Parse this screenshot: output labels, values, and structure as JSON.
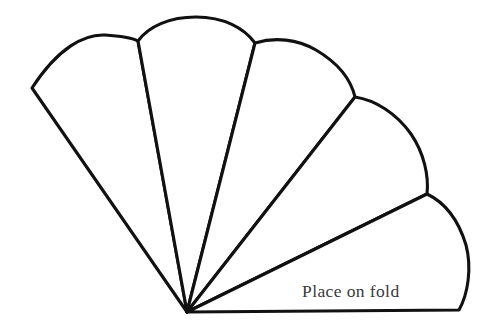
{
  "document": {
    "title": "Fan Pattern Template",
    "kind": "line-art craft pattern",
    "background_color": "#ffffff",
    "line_color": "#111111",
    "width": 492,
    "height": 333
  },
  "labels": {
    "fold_text": "Place on fold",
    "fold_text_color": "#3a3a3a",
    "fold_text_x": 302,
    "fold_text_y": 297
  },
  "pattern": {
    "name": "five-blade folding fan",
    "pivot": {
      "x": 187,
      "y": 312
    },
    "blade_count": 5,
    "vertices": {
      "left_tip": {
        "x": 32,
        "y": 88
      },
      "junction_1_2": {
        "x": 138,
        "y": 41
      },
      "junction_2_3": {
        "x": 255,
        "y": 43
      },
      "junction_3_4": {
        "x": 355,
        "y": 97
      },
      "junction_4_5": {
        "x": 427,
        "y": 194
      },
      "bottom_right_corner": {
        "x": 459,
        "y": 310
      }
    },
    "blades": [
      {
        "id": "blade-1",
        "label": "leftmost blade",
        "path": "M 187 312 L 32 88 C 58 48 84 34 105 35 C 121 36 132 38 138 41 Z"
      },
      {
        "id": "blade-2",
        "label": "second blade",
        "path": "M 187 312 L 138 41 C 149 26 170 17 196 17 C 224 17 244 28 255 43 Z"
      },
      {
        "id": "blade-3",
        "label": "center blade",
        "path": "M 187 312 L 255 43 C 275 37 297 39 316 50 C 338 63 351 80 355 97 Z"
      },
      {
        "id": "blade-4",
        "label": "fourth blade",
        "path": "M 187 312 L 355 97 C 375 100 396 113 411 134 C 424 153 429 176 427 194 Z"
      },
      {
        "id": "blade-5",
        "label": "rightmost blade with fold edge",
        "path": "M 187 312 L 427 194 C 446 203 459 222 466 245 C 472 268 468 294 459 310 L 187 312 Z"
      }
    ],
    "fold_edge": {
      "label": "bottom fold edge",
      "from": {
        "x": 187,
        "y": 312
      },
      "to": {
        "x": 459,
        "y": 310
      }
    }
  }
}
